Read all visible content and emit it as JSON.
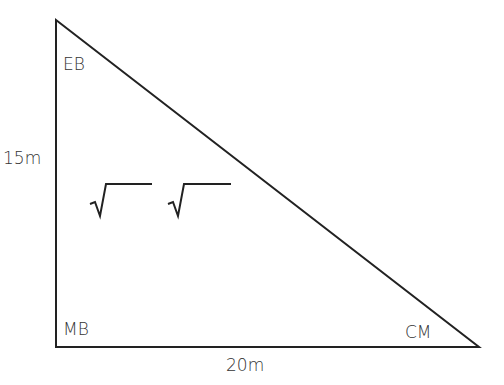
{
  "diagram": {
    "type": "right-triangle",
    "vertices": [
      {
        "label": "EB",
        "x": 56,
        "y": 20
      },
      {
        "label": "MB",
        "x": 56,
        "y": 347
      },
      {
        "label": "CM",
        "x": 479,
        "y": 347
      }
    ],
    "sides": {
      "vertical": "15m",
      "horizontal": "20m"
    },
    "placeholders": [
      "√",
      "√"
    ],
    "line_color": "#222222"
  }
}
